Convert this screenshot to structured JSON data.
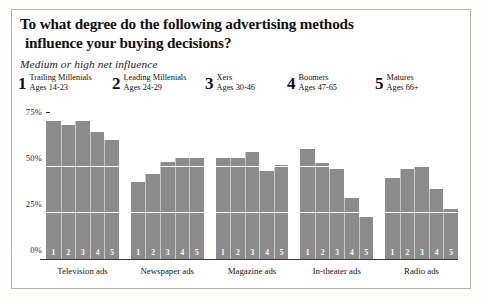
{
  "chart_data": {
    "type": "bar",
    "title": "To what degree do the following advertising methods influence your buying decisions?",
    "title_line1": "To what degree do the following advertising methods",
    "title_line2": "influence your buying decisions?",
    "subtitle": "Medium or high net influence",
    "xlabel": "",
    "ylabel": "",
    "ylim": [
      0,
      80
    ],
    "ytick_labels": [
      "75%",
      "50%",
      "25%",
      "0%"
    ],
    "ytick_values": [
      75,
      50,
      25,
      0
    ],
    "grid": true,
    "legend_position": "top",
    "bar_color": "#8c8c8c",
    "categories": [
      "Television ads",
      "Newspaper ads",
      "Magazine ads",
      "In-theater ads",
      "Radio ads"
    ],
    "series": [
      {
        "name": "Trailing Millenials",
        "key": "1",
        "values": [
          75,
          42,
          55,
          60,
          44
        ]
      },
      {
        "name": "Leading Millenials",
        "key": "2",
        "values": [
          73,
          46,
          55,
          52,
          49
        ]
      },
      {
        "name": "Xers",
        "key": "3",
        "values": [
          75,
          53,
          58,
          49,
          50
        ]
      },
      {
        "name": "Boomers",
        "key": "4",
        "values": [
          69,
          55,
          48,
          33,
          38
        ]
      },
      {
        "name": "Matures",
        "key": "5",
        "values": [
          65,
          55,
          51,
          23,
          27
        ]
      }
    ],
    "legend": [
      {
        "number": "1",
        "name": "Trailing Millenials",
        "ages": "Ages 14-23"
      },
      {
        "number": "2",
        "name": "Leading Millenials",
        "ages": "Ages 24-29"
      },
      {
        "number": "3",
        "name": "Xers",
        "ages": "Ages 30-46"
      },
      {
        "number": "4",
        "name": "Boomers",
        "ages": "Ages 47-65"
      },
      {
        "number": "5",
        "name": "Matures",
        "ages": "Ages 66+"
      }
    ]
  }
}
